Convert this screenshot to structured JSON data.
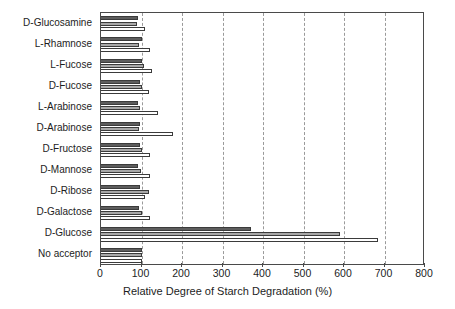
{
  "chart_data": {
    "type": "bar",
    "orientation": "horizontal",
    "title": "",
    "xlabel": "Relative Degree of Starch Degradation (%)",
    "ylabel": "",
    "xlim": [
      0,
      800
    ],
    "xticks": [
      0,
      100,
      200,
      300,
      400,
      500,
      600,
      700,
      800
    ],
    "grid": "vertical-dashed",
    "legend": "none",
    "categories": [
      "D-Glucosamine",
      "L-Rhamnose",
      "L-Fucose",
      "D-Fucose",
      "L-Arabinose",
      "D-Arabinose",
      "D-Fructose",
      "D-Mannose",
      "D-Ribose",
      "D-Galactose",
      "D-Glucose",
      "No acceptor"
    ],
    "series": [
      {
        "name": "series-1",
        "color": "#5d5d5d",
        "values": [
          92,
          102,
          100,
          97,
          92,
          96,
          97,
          92,
          97,
          94,
          370,
          100
        ]
      },
      {
        "name": "series-2",
        "color": "#a8a8a8",
        "values": [
          88,
          93,
          107,
          100,
          96,
          95,
          101,
          99,
          118,
          101,
          590,
          100
        ]
      },
      {
        "name": "series-3",
        "color": "#ffffff",
        "values": [
          109,
          122,
          126,
          118,
          140,
          178,
          121,
          122,
          109,
          122,
          685,
          100
        ]
      }
    ]
  }
}
